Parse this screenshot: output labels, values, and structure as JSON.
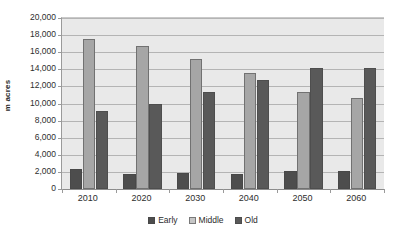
{
  "chart_data": {
    "type": "bar",
    "title": "",
    "xlabel": "",
    "ylabel": "m acres",
    "categories": [
      "2010",
      "2020",
      "2030",
      "2040",
      "2050",
      "2060"
    ],
    "series": [
      {
        "name": "Early",
        "color": "#4d4d4d",
        "values": [
          2300,
          1800,
          1900,
          1800,
          2100,
          2100
        ]
      },
      {
        "name": "Middle",
        "color": "#a6a6a6",
        "values": [
          17600,
          16700,
          15200,
          13600,
          11300,
          10700
        ]
      },
      {
        "name": "Old",
        "color": "#595959",
        "values": [
          9100,
          10000,
          11300,
          12800,
          14100,
          14200
        ]
      }
    ],
    "ylim": [
      0,
      20000
    ],
    "ytick_step": 2000,
    "ytick_labels": [
      "0",
      "2,000",
      "4,000",
      "6,000",
      "8,000",
      "10,000",
      "12,000",
      "14,000",
      "16,000",
      "18,000",
      "20,000"
    ],
    "ytick_values": [
      0,
      2000,
      4000,
      6000,
      8000,
      10000,
      12000,
      14000,
      16000,
      18000,
      20000
    ],
    "grid": true,
    "legend_position": "bottom",
    "plot_background": "#e9e9e9",
    "gridline_color": "#b4b4b4"
  }
}
